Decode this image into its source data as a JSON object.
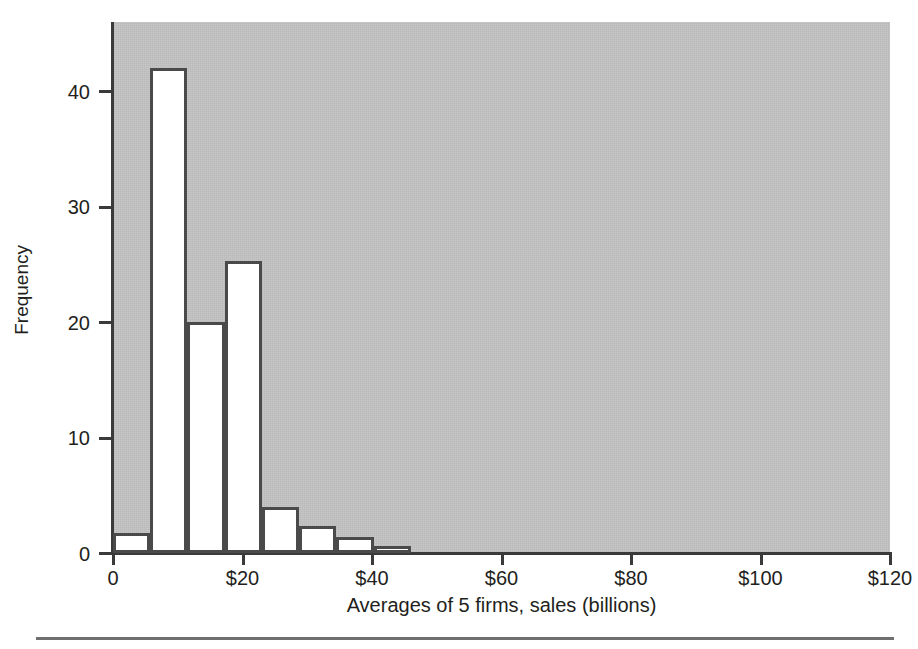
{
  "chart_data": {
    "type": "bar",
    "title": "",
    "subtitle": "",
    "xlabel": "Averages of 5 firms, sales (billions)",
    "ylabel": "Frequency",
    "xlim": [
      0,
      120
    ],
    "ylim": [
      0,
      46
    ],
    "grid": false,
    "legend": null,
    "plot_background_color": "#c2c2c2",
    "bar_fill_color": "#ffffff",
    "bar_edge_color": "#4a4a4a",
    "x_tick_labels": [
      "0",
      "$20",
      "$40",
      "$60",
      "$80",
      "$100",
      "$120"
    ],
    "x_tick_values": [
      0,
      20,
      40,
      60,
      80,
      100,
      120
    ],
    "y_tick_labels": [
      "0",
      "10",
      "20",
      "30",
      "40"
    ],
    "y_tick_values": [
      0,
      10,
      20,
      30,
      40
    ],
    "bin_width": 5.75,
    "bins": [
      {
        "x0": 0.0,
        "x1": 5.75,
        "value": 1.7
      },
      {
        "x0": 5.75,
        "x1": 11.5,
        "value": 42.0
      },
      {
        "x0": 11.5,
        "x1": 17.25,
        "value": 20.0
      },
      {
        "x0": 17.25,
        "x1": 23.0,
        "value": 25.3
      },
      {
        "x0": 23.0,
        "x1": 28.75,
        "value": 4.0
      },
      {
        "x0": 28.75,
        "x1": 34.5,
        "value": 2.3
      },
      {
        "x0": 34.5,
        "x1": 40.25,
        "value": 1.4
      },
      {
        "x0": 40.25,
        "x1": 46.0,
        "value": 0.6
      }
    ],
    "categories": [
      "0-5.75",
      "5.75-11.5",
      "11.5-17.25",
      "17.25-23",
      "23-28.75",
      "28.75-34.5",
      "34.5-40.25",
      "40.25-46"
    ],
    "values": [
      1.7,
      42.0,
      20.0,
      25.3,
      4.0,
      2.3,
      1.4,
      0.6
    ]
  }
}
